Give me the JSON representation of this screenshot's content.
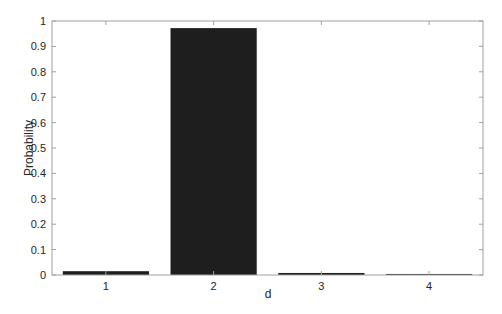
{
  "chart_data": {
    "type": "bar",
    "title": "",
    "xlabel": "d",
    "ylabel": "Probability",
    "categories": [
      "1",
      "2",
      "3",
      "4"
    ],
    "values": [
      0.015,
      0.972,
      0.008,
      0.004
    ],
    "ylim": [
      0,
      1
    ],
    "yticks": [
      "0",
      "0.1",
      "0.2",
      "0.3",
      "0.4",
      "0.5",
      "0.6",
      "0.7",
      "0.8",
      "0.9",
      "1"
    ],
    "grid": false,
    "legend": null,
    "bar_color": "#1e1e1e",
    "axis_color": "#a0a0a0"
  }
}
